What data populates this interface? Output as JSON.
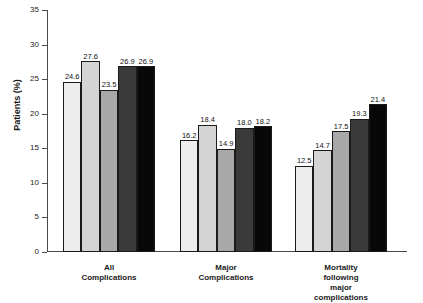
{
  "chart_data": {
    "type": "bar",
    "title": "",
    "xlabel": "",
    "ylabel": "Patients (%)",
    "ylim": [
      0,
      35
    ],
    "yticks": [
      0,
      5,
      10,
      15,
      20,
      25,
      30,
      35
    ],
    "grid": false,
    "legend": "none",
    "categories": [
      "All Complications",
      "Major Complications",
      "Mortality following\nmajor complications"
    ],
    "series": [
      {
        "name": "series-1",
        "color": "#ededed",
        "values": [
          24.6,
          16.2,
          12.5
        ]
      },
      {
        "name": "series-2",
        "color": "#d4d4d4",
        "values": [
          27.6,
          18.4,
          14.7
        ]
      },
      {
        "name": "series-3",
        "color": "#a8a8a8",
        "values": [
          23.5,
          14.9,
          17.5
        ]
      },
      {
        "name": "series-4",
        "color": "#3a3a3a",
        "values": [
          26.9,
          18.0,
          19.3
        ]
      },
      {
        "name": "series-5",
        "color": "#080808",
        "values": [
          26.9,
          18.2,
          21.4
        ]
      }
    ],
    "value_labels": [
      [
        "24.6",
        "27.6",
        "23.5",
        "26.9",
        "26.9"
      ],
      [
        "16.2",
        "18.4",
        "14.9",
        "18.0",
        "18.2"
      ],
      [
        "12.5",
        "14.7",
        "17.5",
        "19.3",
        "21.4"
      ]
    ],
    "ytick_labels": [
      "0",
      "5",
      "10",
      "15",
      "20",
      "25",
      "30",
      "35"
    ]
  }
}
